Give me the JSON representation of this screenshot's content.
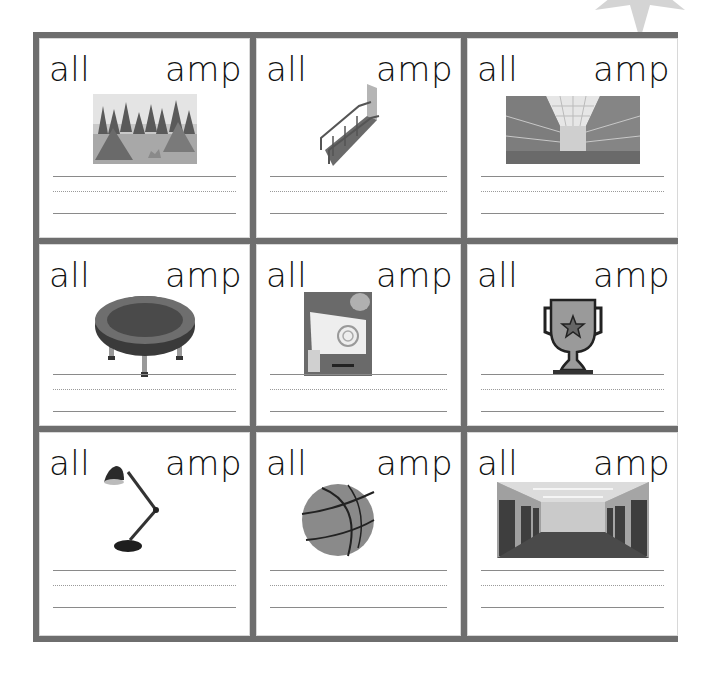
{
  "worksheet": {
    "decoration": "starburst-icon",
    "cells": [
      {
        "left_word": "all",
        "right_word": "amp",
        "picture": "camp-icon"
      },
      {
        "left_word": "all",
        "right_word": "amp",
        "picture": "ramp-icon"
      },
      {
        "left_word": "all",
        "right_word": "amp",
        "picture": "mall-icon"
      },
      {
        "left_word": "all",
        "right_word": "amp",
        "picture": "trampoline-icon"
      },
      {
        "left_word": "all",
        "right_word": "amp",
        "picture": "stamp-icon"
      },
      {
        "left_word": "all",
        "right_word": "amp",
        "picture": "trophy-icon"
      },
      {
        "left_word": "all",
        "right_word": "amp",
        "picture": "lamp-icon"
      },
      {
        "left_word": "all",
        "right_word": "amp",
        "picture": "ball-icon"
      },
      {
        "left_word": "all",
        "right_word": "amp",
        "picture": "hall-icon"
      }
    ]
  }
}
